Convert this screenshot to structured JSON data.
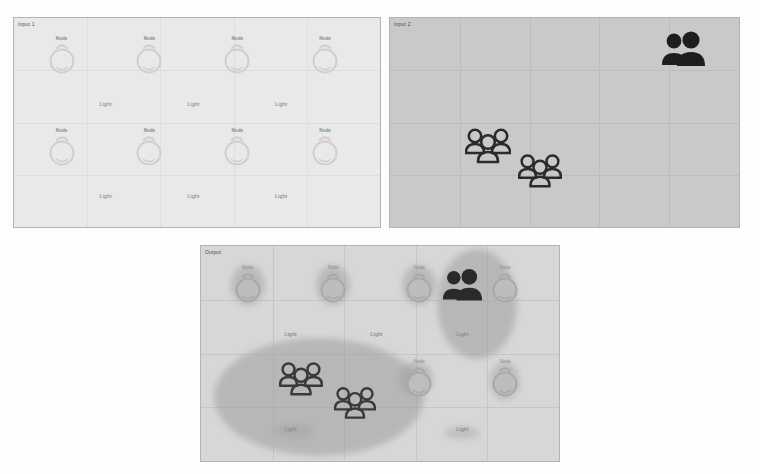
{
  "figure": {
    "background": "#fdfdfd",
    "panel_count": 3
  },
  "panels": [
    {
      "id": "panel-1",
      "label": "Input 1",
      "background": "#e9e9e9",
      "border": "#b4b4b4",
      "grid": {
        "rows": 4,
        "cols": 5,
        "color": "#dedede",
        "visible": true
      },
      "nodes": [
        {
          "label": "Node",
          "x": 13,
          "y": 18,
          "icon": "bulb-icon",
          "style": "faint"
        },
        {
          "label": "Node",
          "x": 37,
          "y": 18,
          "icon": "bulb-icon",
          "style": "faint"
        },
        {
          "label": "Node",
          "x": 61,
          "y": 18,
          "icon": "bulb-icon",
          "style": "faint"
        },
        {
          "label": "Node",
          "x": 85,
          "y": 18,
          "icon": "bulb-icon",
          "style": "faint"
        },
        {
          "label": "Node",
          "x": 13,
          "y": 62,
          "icon": "bulb-icon",
          "style": "faint"
        },
        {
          "label": "Node",
          "x": 37,
          "y": 62,
          "icon": "bulb-icon",
          "style": "faint"
        },
        {
          "label": "Node",
          "x": 61,
          "y": 62,
          "icon": "bulb-icon",
          "style": "faint"
        },
        {
          "label": "Node",
          "x": 85,
          "y": 62,
          "icon": "bulb-icon",
          "style": "faint"
        }
      ],
      "text_labels": [
        {
          "text": "Light",
          "x": 25,
          "y": 41
        },
        {
          "text": "Light",
          "x": 49,
          "y": 41
        },
        {
          "text": "Light",
          "x": 73,
          "y": 41
        },
        {
          "text": "Light",
          "x": 25,
          "y": 85
        },
        {
          "text": "Light",
          "x": 49,
          "y": 85
        },
        {
          "text": "Light",
          "x": 73,
          "y": 85
        }
      ],
      "actors": []
    },
    {
      "id": "panel-2",
      "label": "Input 2",
      "background": "#c9c9c9",
      "border": "#b4b4b4",
      "grid": {
        "rows": 4,
        "cols": 5,
        "color": "#bdbdbd",
        "visible": true
      },
      "nodes": [],
      "text_labels": [],
      "actors": [
        {
          "icon": "two-people-icon",
          "x": 84,
          "y": 16,
          "size": 46,
          "style": "filled",
          "color": "#1e1e1e"
        },
        {
          "icon": "group-people-icon",
          "x": 28,
          "y": 62,
          "size": 46,
          "style": "outline",
          "color": "#2b2b2b"
        },
        {
          "icon": "group-people-icon",
          "x": 43,
          "y": 74,
          "size": 44,
          "style": "outline",
          "color": "#2b2b2b"
        }
      ]
    },
    {
      "id": "panel-3",
      "label": "Output",
      "background": "#d7d7d7",
      "border": "#b4b4b4",
      "grid": {
        "rows": 4,
        "cols": 5,
        "color": "#c6c6c6",
        "visible": true
      },
      "nodes": [
        {
          "label": "Node",
          "x": 13,
          "y": 18,
          "icon": "bulb-icon",
          "style": "mid"
        },
        {
          "label": "Node",
          "x": 37,
          "y": 18,
          "icon": "bulb-icon",
          "style": "mid"
        },
        {
          "label": "Node",
          "x": 61,
          "y": 18,
          "icon": "bulb-icon",
          "style": "mid"
        },
        {
          "label": "Node",
          "x": 85,
          "y": 18,
          "icon": "bulb-icon",
          "style": "mid"
        },
        {
          "label": "Node",
          "x": 61,
          "y": 62,
          "icon": "bulb-icon",
          "style": "mid"
        },
        {
          "label": "Node",
          "x": 85,
          "y": 62,
          "icon": "bulb-icon",
          "style": "mid"
        }
      ],
      "text_labels": [
        {
          "text": "Light",
          "x": 25,
          "y": 41
        },
        {
          "text": "Light",
          "x": 49,
          "y": 41
        },
        {
          "text": "Light",
          "x": 73,
          "y": 41
        },
        {
          "text": "Light",
          "x": 25,
          "y": 85
        },
        {
          "text": "Light",
          "x": 73,
          "y": 85
        }
      ],
      "actors": [
        {
          "icon": "two-people-icon",
          "x": 73,
          "y": 19,
          "size": 42,
          "style": "filled",
          "color": "#2a2a2a"
        },
        {
          "icon": "group-people-icon",
          "x": 28,
          "y": 63,
          "size": 44,
          "style": "outline",
          "color": "#3a3a3a"
        },
        {
          "icon": "group-people-icon",
          "x": 43,
          "y": 74,
          "size": 42,
          "style": "outline",
          "color": "#3a3a3a"
        }
      ],
      "heat_blobs": [
        {
          "x": 33,
          "y": 70,
          "w": 210,
          "h": 118,
          "color": "#9e9e9e",
          "opacity": 0.55
        },
        {
          "x": 77,
          "y": 27,
          "w": 80,
          "h": 110,
          "color": "#9e9e9e",
          "opacity": 0.55
        },
        {
          "x": 60,
          "y": 62,
          "w": 34,
          "h": 34,
          "color": "#9e9e9e",
          "opacity": 0.5
        },
        {
          "x": 85,
          "y": 63,
          "w": 30,
          "h": 38,
          "color": "#9e9e9e",
          "opacity": 0.45
        },
        {
          "x": 13,
          "y": 18,
          "w": 34,
          "h": 40,
          "color": "#9e9e9e",
          "opacity": 0.5
        },
        {
          "x": 37,
          "y": 18,
          "w": 34,
          "h": 40,
          "color": "#9e9e9e",
          "opacity": 0.5
        },
        {
          "x": 61,
          "y": 18,
          "w": 34,
          "h": 40,
          "color": "#9e9e9e",
          "opacity": 0.5
        },
        {
          "x": 26,
          "y": 86,
          "w": 40,
          "h": 14,
          "color": "#9e9e9e",
          "opacity": 0.4
        },
        {
          "x": 73,
          "y": 87,
          "w": 36,
          "h": 13,
          "color": "#9e9e9e",
          "opacity": 0.4
        }
      ]
    }
  ]
}
